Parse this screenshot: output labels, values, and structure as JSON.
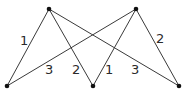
{
  "graph": {
    "type": "complete-bipartite",
    "nodes": [
      {
        "id": "t1",
        "x": 49,
        "y": 9
      },
      {
        "id": "t2",
        "x": 136,
        "y": 9
      },
      {
        "id": "b1",
        "x": 7,
        "y": 86
      },
      {
        "id": "b2",
        "x": 93,
        "y": 86
      },
      {
        "id": "b3",
        "x": 179,
        "y": 86
      }
    ],
    "edges": [
      {
        "from": "t1",
        "to": "b1",
        "weight": "1",
        "lx": 24,
        "ly": 45
      },
      {
        "from": "t1",
        "to": "b2",
        "weight": "2",
        "lx": 77,
        "ly": 74
      },
      {
        "from": "t1",
        "to": "b3",
        "weight": "3",
        "lx": 136,
        "ly": 74
      },
      {
        "from": "t2",
        "to": "b1",
        "weight": "3",
        "lx": 50,
        "ly": 74
      },
      {
        "from": "t2",
        "to": "b2",
        "weight": "1",
        "lx": 110,
        "ly": 74
      },
      {
        "from": "t2",
        "to": "b3",
        "weight": "2",
        "lx": 160,
        "ly": 43
      }
    ]
  }
}
